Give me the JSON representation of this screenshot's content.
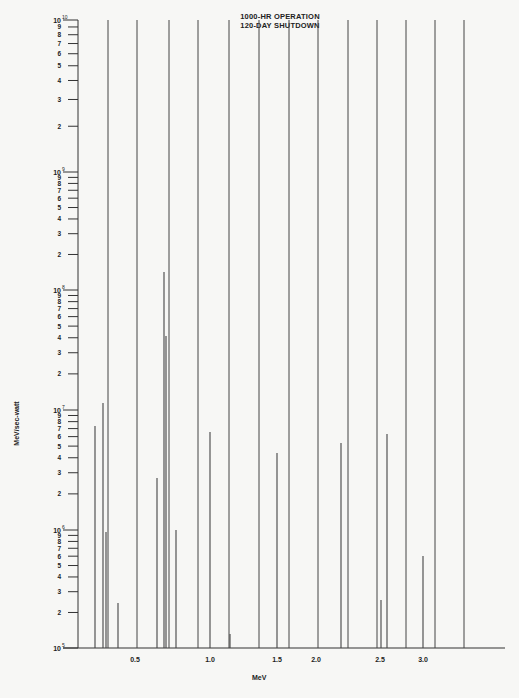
{
  "chart_data": {
    "type": "bar",
    "subtype": "spectral-line (stick) plot, log y-axis",
    "title": "1000-HR OPERATION",
    "subtitle": "120-DAY SHUTDOWN",
    "xlabel": "MeV",
    "ylabel": "MeV/sec-watt",
    "yscale": "log",
    "ylim": [
      100000,
      10000000000
    ],
    "y_decade_labels": [
      "10^5",
      "10^6",
      "10^7",
      "10^8",
      "10^9",
      "10^10"
    ],
    "y_minor_tick_labels": [
      "2",
      "3",
      "4",
      "5",
      "6",
      "7",
      "8",
      "9"
    ],
    "x_tick_labels": [
      "0.5",
      "1.0",
      "1.5",
      "2.0",
      "2.5",
      "3.0"
    ],
    "grid": false,
    "legend": null,
    "full_height_lines_note": "Many lines extend above the top of the plotted range (>1e10)",
    "full_height_lines_px": [
      108,
      137,
      169,
      198,
      229,
      259,
      289,
      318,
      348,
      377,
      406,
      435,
      464
    ],
    "lines": [
      {
        "energy_mev": 0.22,
        "value": 7000000
      },
      {
        "energy_mev": 0.27,
        "value": 11000000
      },
      {
        "energy_mev": 0.29,
        "value": 950000
      },
      {
        "energy_mev": 0.36,
        "value": 250000
      },
      {
        "energy_mev": 0.51,
        "value": 40000000
      },
      {
        "energy_mev": 0.65,
        "value": 2800000
      },
      {
        "energy_mev": 0.7,
        "value": 130000000
      },
      {
        "energy_mev": 0.77,
        "value": 1000000
      },
      {
        "energy_mev": 1.0,
        "value": 6500000
      },
      {
        "energy_mev": 1.14,
        "value": 130000
      },
      {
        "energy_mev": 1.5,
        "value": 4500000
      },
      {
        "energy_mev": 2.19,
        "value": 5500000
      },
      {
        "energy_mev": 2.52,
        "value": 270000
      },
      {
        "energy_mev": 2.6,
        "value": 6500000
      },
      {
        "energy_mev": 2.96,
        "value": 600000
      }
    ]
  },
  "header": {
    "line1": "1000-HR OPERATION",
    "line2": "120-DAY SHUTDOWN"
  },
  "axes": {
    "xlabel": "MeV",
    "ylabel": "MeV/sec-watt"
  },
  "layout": {
    "axis_x": 78,
    "baseline_y": 648,
    "right_x": 505,
    "decades": [
      {
        "label": "10",
        "exp": "5",
        "y": 648
      },
      {
        "label": "10",
        "exp": "6",
        "y": 530
      },
      {
        "label": "10",
        "exp": "7",
        "y": 410
      },
      {
        "label": "10",
        "exp": "8",
        "y": 290
      },
      {
        "label": "10",
        "exp": "9",
        "y": 172
      },
      {
        "label": "10",
        "exp": "10",
        "y": 20
      }
    ],
    "xticks": [
      {
        "label": "0.5",
        "x": 135
      },
      {
        "label": "1.0",
        "x": 210
      },
      {
        "label": "1.5",
        "x": 277
      },
      {
        "label": "2.0",
        "x": 316
      },
      {
        "label": "2.5",
        "x": 380
      },
      {
        "label": "3.0",
        "x": 423
      }
    ],
    "full_lines": [
      108,
      137,
      169,
      198,
      229,
      259,
      289,
      318,
      348,
      377,
      406,
      435,
      464
    ],
    "full_top": 20,
    "spikes": [
      {
        "x": 95,
        "top": 426
      },
      {
        "x": 103,
        "top": 403
      },
      {
        "x": 106,
        "top": 532
      },
      {
        "x": 118,
        "top": 603
      },
      {
        "x": 166,
        "top": 336
      },
      {
        "x": 157,
        "top": 478
      },
      {
        "x": 164,
        "top": 272
      },
      {
        "x": 176,
        "top": 530
      },
      {
        "x": 210,
        "top": 432
      },
      {
        "x": 230,
        "top": 634
      },
      {
        "x": 277,
        "top": 453
      },
      {
        "x": 341,
        "top": 443
      },
      {
        "x": 381,
        "top": 600
      },
      {
        "x": 387,
        "top": 434
      },
      {
        "x": 423,
        "top": 556
      }
    ]
  }
}
